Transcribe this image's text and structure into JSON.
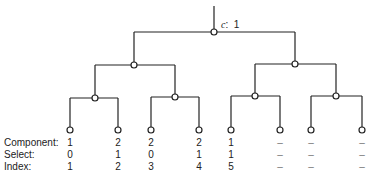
{
  "root": {
    "variable": "c",
    "value": "1"
  },
  "tree": {
    "levels": 3,
    "leaf_count": 8
  },
  "rows": {
    "labels": [
      "Component:",
      "Select:",
      "Index:"
    ],
    "component": [
      "1",
      "2",
      "2",
      "2",
      "1",
      "–",
      "–",
      "–"
    ],
    "select": [
      "0",
      "1",
      "0",
      "1",
      "1",
      "–",
      "–",
      "–"
    ],
    "index": [
      "1",
      "2",
      "3",
      "4",
      "5",
      "–",
      "–",
      "–"
    ]
  },
  "colors": {
    "line": "#222222",
    "node_fill": "#ffffff"
  }
}
